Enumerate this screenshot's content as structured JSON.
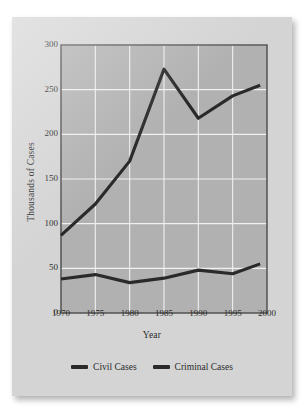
{
  "figure": {
    "background_color": "#d4d4d4",
    "plot_background_color": "#b1b1b1",
    "grid_color": "#f0f0f0",
    "line_color": "#2a2a2a",
    "frame_color": "#4a4a4a"
  },
  "chart_data": {
    "type": "line",
    "title": "",
    "xlabel": "Year",
    "ylabel": "Thousands of Cases",
    "xlim": [
      1970,
      2000
    ],
    "ylim": [
      0,
      300
    ],
    "xticks": [
      "1970",
      "1975",
      "1980",
      "1985",
      "1990",
      "1995",
      "2000"
    ],
    "yticks": [
      "0",
      "50",
      "100",
      "150",
      "200",
      "250",
      "300"
    ],
    "grid": true,
    "legend_position": "bottom",
    "x": [
      1970,
      1975,
      1980,
      1985,
      1990,
      1995,
      1999
    ],
    "series": [
      {
        "name": "Civil Cases",
        "color": "#2a2a2a",
        "values": [
          87,
          122,
          170,
          273,
          218,
          243,
          255
        ]
      },
      {
        "name": "Criminal Cases",
        "color": "#2a2a2a",
        "values": [
          38,
          43,
          34,
          39,
          48,
          44,
          55
        ]
      }
    ]
  },
  "legend": {
    "items": [
      {
        "label": "Civil Cases"
      },
      {
        "label": "Criminal Cases"
      }
    ]
  }
}
